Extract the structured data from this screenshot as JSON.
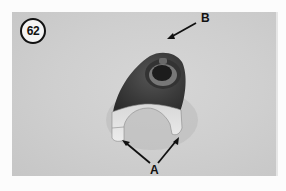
{
  "figure": {
    "number": "62",
    "type": "photograph"
  },
  "callouts": {
    "a": "A",
    "b": "B"
  },
  "colors": {
    "background": "#fcfcfc",
    "photo_background": "#cfcfcf",
    "part_dark": "#3a3a3a",
    "part_light": "#e4e4e4",
    "text": "#111111"
  }
}
